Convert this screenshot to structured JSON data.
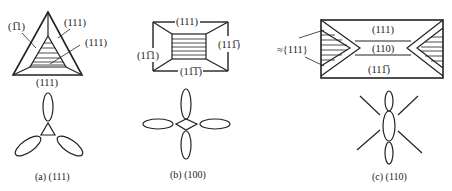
{
  "figure": {
    "panels": [
      {
        "id": "a",
        "caption": "(a) (111)",
        "face_labels": {
          "left": "(1̅1̅ 1)",
          "top_right": "(111)",
          "inner_right": "(111)",
          "bottom": "(111)"
        }
      },
      {
        "id": "b",
        "caption": "(b) (100)",
        "face_labels": {
          "top": "(111)",
          "right": "(111̅)",
          "left": "(11̅1)",
          "bottom": "(11̅1̅)"
        }
      },
      {
        "id": "c",
        "caption": "(c) (110)",
        "face_labels": {
          "side_note": "≈{111}",
          "top": "(111)",
          "middle": "(110)",
          "bottom": "(111̅)"
        }
      }
    ]
  },
  "text": {
    "a_left": "(1̅1)",
    "a_top_right": "(111)",
    "a_inner_right": "(111)",
    "a_bottom": "(111)",
    "a_caption": "(a) (111)",
    "b_top": "(111)",
    "b_right": "(111̅)",
    "b_left": "(11̅1)",
    "b_bottom": "(11̅1̅)",
    "b_caption": "(b) (100)",
    "c_note": "≈{111}",
    "c_top": "(111)",
    "c_mid": "(110)",
    "c_bottom": "(111̅)",
    "c_caption": "(c) (110)"
  }
}
